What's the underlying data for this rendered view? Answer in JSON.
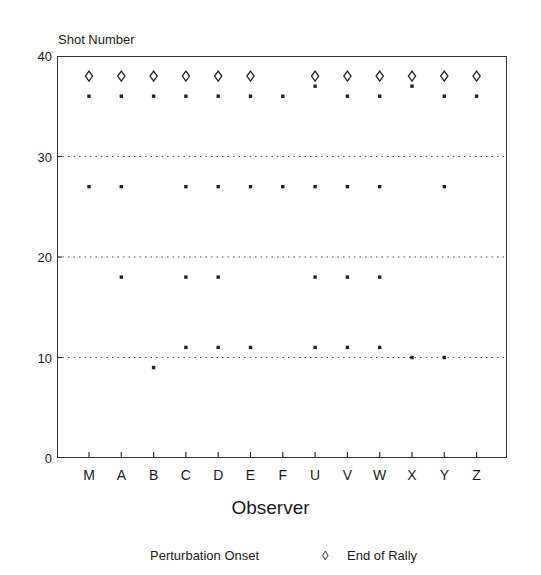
{
  "caption_fragment": "Ch. 6   Changes in perceived ... rally,",
  "chart_data": {
    "type": "scatter",
    "title": "",
    "ylabel": "Shot Number",
    "xlabel": "Observer",
    "ylim": [
      0,
      40
    ],
    "yticks": [
      0,
      10,
      20,
      30,
      40
    ],
    "grid": "horizontal dotted at 10, 20, 30",
    "categories": [
      "M",
      "A",
      "B",
      "C",
      "D",
      "E",
      "F",
      "U",
      "V",
      "W",
      "X",
      "Y",
      "Z"
    ],
    "legend_position": "bottom",
    "series": [
      {
        "name": "Perturbation Onset",
        "marker": "square-dot",
        "points": {
          "M": [
            36,
            27
          ],
          "A": [
            36,
            27,
            18
          ],
          "B": [
            36,
            9
          ],
          "C": [
            36,
            27,
            18,
            11
          ],
          "D": [
            36,
            27,
            18,
            11
          ],
          "E": [
            36,
            27,
            11
          ],
          "F": [
            36,
            27
          ],
          "U": [
            37,
            27,
            18,
            11
          ],
          "V": [
            36,
            27,
            18,
            11
          ],
          "W": [
            36,
            27,
            18,
            11
          ],
          "X": [
            37,
            10
          ],
          "Y": [
            36,
            27,
            10
          ],
          "Z": [
            36
          ]
        }
      },
      {
        "name": "End of Rally",
        "marker": "open-diamond",
        "points": {
          "M": [
            38
          ],
          "A": [
            38
          ],
          "B": [
            38
          ],
          "C": [
            38
          ],
          "D": [
            38
          ],
          "E": [
            38
          ],
          "F": [],
          "U": [
            38
          ],
          "V": [
            38
          ],
          "W": [
            38
          ],
          "X": [
            38
          ],
          "Y": [
            38
          ],
          "Z": [
            38
          ]
        }
      }
    ]
  },
  "axis": {
    "y_title": "Shot Number",
    "x_title": "Observer",
    "y_ticks": [
      "40",
      "30",
      "20",
      "10",
      "0"
    ]
  },
  "legend": {
    "onset_label": "Perturbation Onset",
    "end_label": "End of Rally",
    "end_symbol": "◊"
  }
}
